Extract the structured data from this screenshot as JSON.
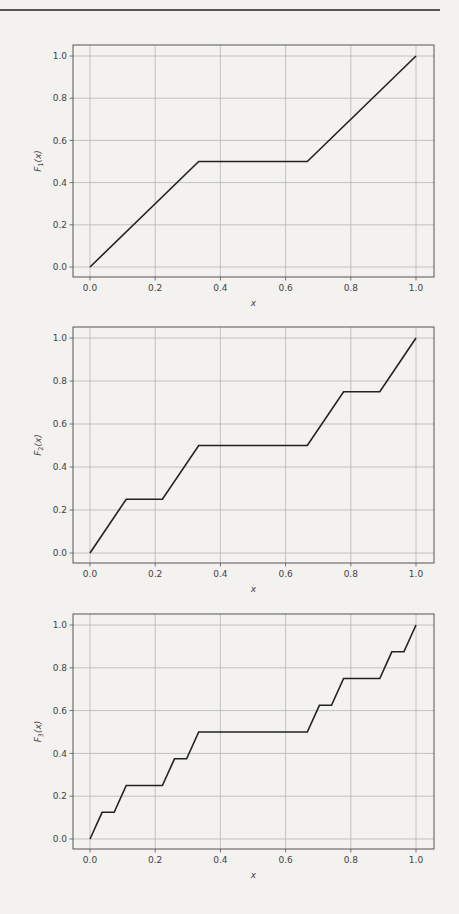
{
  "figure": {
    "line_color": "#222222",
    "grid_color": "#b5b5b5",
    "frame_color": "#555555"
  },
  "chart_data": [
    {
      "type": "line",
      "title": "",
      "xlabel": "x",
      "ylabel": "F_1(x)",
      "ylabel_main": "F",
      "ylabel_sub": "1",
      "xlim": [
        -0.05,
        1.05
      ],
      "ylim": [
        -0.05,
        1.05
      ],
      "grid": true,
      "xticks": [
        "0.0",
        "0.2",
        "0.4",
        "0.6",
        "0.8",
        "1.0"
      ],
      "yticks": [
        "0.0",
        "0.2",
        "0.4",
        "0.6",
        "0.8",
        "1.0"
      ],
      "x": [
        0,
        0.3333,
        0.6667,
        1
      ],
      "y": [
        0,
        0.5,
        0.5,
        1
      ]
    },
    {
      "type": "line",
      "title": "",
      "xlabel": "x",
      "ylabel": "F_2(x)",
      "ylabel_main": "F",
      "ylabel_sub": "2",
      "xlim": [
        -0.05,
        1.05
      ],
      "ylim": [
        -0.05,
        1.05
      ],
      "grid": true,
      "xticks": [
        "0.0",
        "0.2",
        "0.4",
        "0.6",
        "0.8",
        "1.0"
      ],
      "yticks": [
        "0.0",
        "0.2",
        "0.4",
        "0.6",
        "0.8",
        "1.0"
      ],
      "x": [
        0,
        0.1111,
        0.2222,
        0.3333,
        0.6667,
        0.7778,
        0.8889,
        1
      ],
      "y": [
        0,
        0.25,
        0.25,
        0.5,
        0.5,
        0.75,
        0.75,
        1
      ]
    },
    {
      "type": "line",
      "title": "",
      "xlabel": "x",
      "ylabel": "F_3(x)",
      "ylabel_main": "F",
      "ylabel_sub": "3",
      "xlim": [
        -0.05,
        1.05
      ],
      "ylim": [
        -0.05,
        1.05
      ],
      "grid": true,
      "xticks": [
        "0.0",
        "0.2",
        "0.4",
        "0.6",
        "0.8",
        "1.0"
      ],
      "yticks": [
        "0.0",
        "0.2",
        "0.4",
        "0.6",
        "0.8",
        "1.0"
      ],
      "x": [
        0,
        0.037,
        0.0741,
        0.1111,
        0.2222,
        0.2593,
        0.2963,
        0.3333,
        0.6667,
        0.7037,
        0.7407,
        0.7778,
        0.8889,
        0.9259,
        0.963,
        1
      ],
      "y": [
        0,
        0.125,
        0.125,
        0.25,
        0.25,
        0.375,
        0.375,
        0.5,
        0.5,
        0.625,
        0.625,
        0.75,
        0.75,
        0.875,
        0.875,
        1
      ]
    }
  ]
}
